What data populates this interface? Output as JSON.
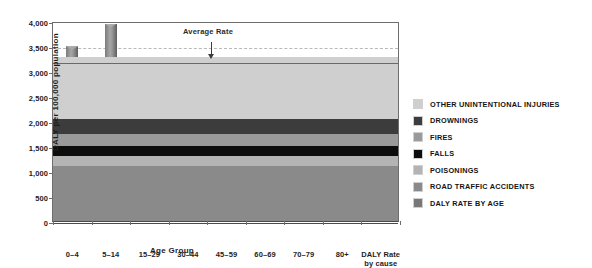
{
  "chart_data": {
    "type": "bar",
    "title": "",
    "xlabel": "Age Group",
    "ylabel": "DALY per 100,000 population",
    "ylim": [
      0,
      4000
    ],
    "ytick_values": [
      0,
      500,
      1000,
      1500,
      2000,
      2500,
      3000,
      3500,
      4000
    ],
    "ytick_labels": [
      "0",
      "500",
      "1,000",
      "1,500",
      "2,000",
      "2,500",
      "3,000",
      "3,500",
      "4,000"
    ],
    "grid": "horizontal-dashed",
    "legend_position": "right",
    "categories": [
      "0–4",
      "5–14",
      "15–29",
      "30–44",
      "45–59",
      "60–69",
      "70–79",
      "80+"
    ],
    "values": [
      3500,
      3950,
      3000,
      3000,
      2250,
      1500,
      1150,
      800
    ],
    "annotations": [
      {
        "label": "Average Rate",
        "value": 3200,
        "type": "horizontal-line-with-arrow"
      }
    ],
    "stacked_bar": {
      "category": "DALY Rate",
      "category_sub": "by cause",
      "total": 3280,
      "segments": [
        {
          "name": "ROAD TRAFFIC ACCIDENTS",
          "value": 1100,
          "color": "#8a8a8a"
        },
        {
          "name": "POISONINGS",
          "value": 200,
          "color": "#b4b4b4"
        },
        {
          "name": "FALLS",
          "value": 200,
          "color": "#0d0d0d"
        },
        {
          "name": "FIRES",
          "value": 240,
          "color": "#9a9a9a"
        },
        {
          "name": "DROWNINGS",
          "value": 300,
          "color": "#3c3c3c"
        },
        {
          "name": "OTHER UNINTENTIONAL INJURIES",
          "value": 1240,
          "color": "#cfcfcf"
        }
      ]
    },
    "legend": [
      {
        "label": "OTHER UNINTENTIONAL INJURIES",
        "color": "#cfcfcf"
      },
      {
        "label": "DROWNINGS",
        "color": "#3c3c3c"
      },
      {
        "label": "FIRES",
        "color": "#9a9a9a"
      },
      {
        "label": "FALLS",
        "color": "#0d0d0d"
      },
      {
        "label": "POISONINGS",
        "color": "#b4b4b4"
      },
      {
        "label": "ROAD TRAFFIC ACCIDENTS",
        "color": "#8a8a8a"
      },
      {
        "label": "DALY RATE BY AGE",
        "color": "#787878"
      }
    ]
  }
}
